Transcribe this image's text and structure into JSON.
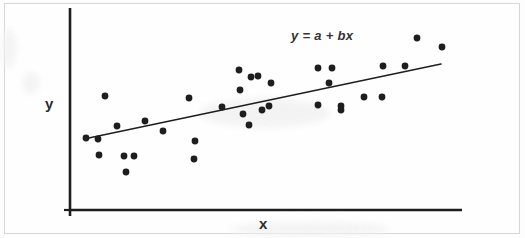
{
  "figure": {
    "background_color": "#fdfdfd",
    "frame_color": "#d7d7d7",
    "ink_color": "#1e1e1e"
  },
  "labels": {
    "y_axis": "y",
    "x_axis": "x",
    "equation": "y = a + bx"
  },
  "chart_data": {
    "type": "scatter",
    "title": "",
    "subtitle": "",
    "xlabel": "x",
    "ylabel": "y",
    "annotations": [
      {
        "text": "y = a + bx",
        "x_px": 291,
        "y_px": 28,
        "style": "italic"
      }
    ],
    "grid": false,
    "legend": null,
    "axes": {
      "x_axis_px": {
        "x1": 70,
        "y1": 210,
        "x2": 462,
        "y2": 210
      },
      "y_axis_px": {
        "x1": 70,
        "y1": 8,
        "x2": 70,
        "y2": 216
      },
      "tick_labels_x": [],
      "tick_labels_y": [],
      "xlim": [
        0,
        1
      ],
      "ylim": [
        0,
        1
      ]
    },
    "point_radius_px": 3.4,
    "point_color": "#1e1e1e",
    "points_px": [
      {
        "x": 86,
        "y": 138
      },
      {
        "x": 98,
        "y": 139
      },
      {
        "x": 105,
        "y": 96
      },
      {
        "x": 117,
        "y": 126
      },
      {
        "x": 99,
        "y": 155
      },
      {
        "x": 124,
        "y": 156
      },
      {
        "x": 134,
        "y": 156
      },
      {
        "x": 126,
        "y": 172
      },
      {
        "x": 145,
        "y": 121
      },
      {
        "x": 163,
        "y": 131
      },
      {
        "x": 189,
        "y": 98
      },
      {
        "x": 195,
        "y": 141
      },
      {
        "x": 194,
        "y": 159
      },
      {
        "x": 222,
        "y": 107
      },
      {
        "x": 239,
        "y": 70
      },
      {
        "x": 243,
        "y": 114
      },
      {
        "x": 251,
        "y": 77
      },
      {
        "x": 258,
        "y": 76
      },
      {
        "x": 240,
        "y": 90
      },
      {
        "x": 262,
        "y": 110
      },
      {
        "x": 249,
        "y": 125
      },
      {
        "x": 271,
        "y": 83
      },
      {
        "x": 269,
        "y": 106
      },
      {
        "x": 318,
        "y": 105
      },
      {
        "x": 329,
        "y": 83
      },
      {
        "x": 332,
        "y": 68
      },
      {
        "x": 341,
        "y": 106
      },
      {
        "x": 318,
        "y": 68
      },
      {
        "x": 341,
        "y": 110
      },
      {
        "x": 364,
        "y": 97
      },
      {
        "x": 382,
        "y": 97
      },
      {
        "x": 383,
        "y": 66
      },
      {
        "x": 405,
        "y": 66
      },
      {
        "x": 417,
        "y": 38
      },
      {
        "x": 442,
        "y": 47
      }
    ],
    "regression_line": {
      "label": "y = a + bx",
      "x1_px": 84,
      "y1_px": 139,
      "x2_px": 441,
      "y2_px": 64,
      "color": "#1e1e1e",
      "width_px": 1.6
    }
  }
}
